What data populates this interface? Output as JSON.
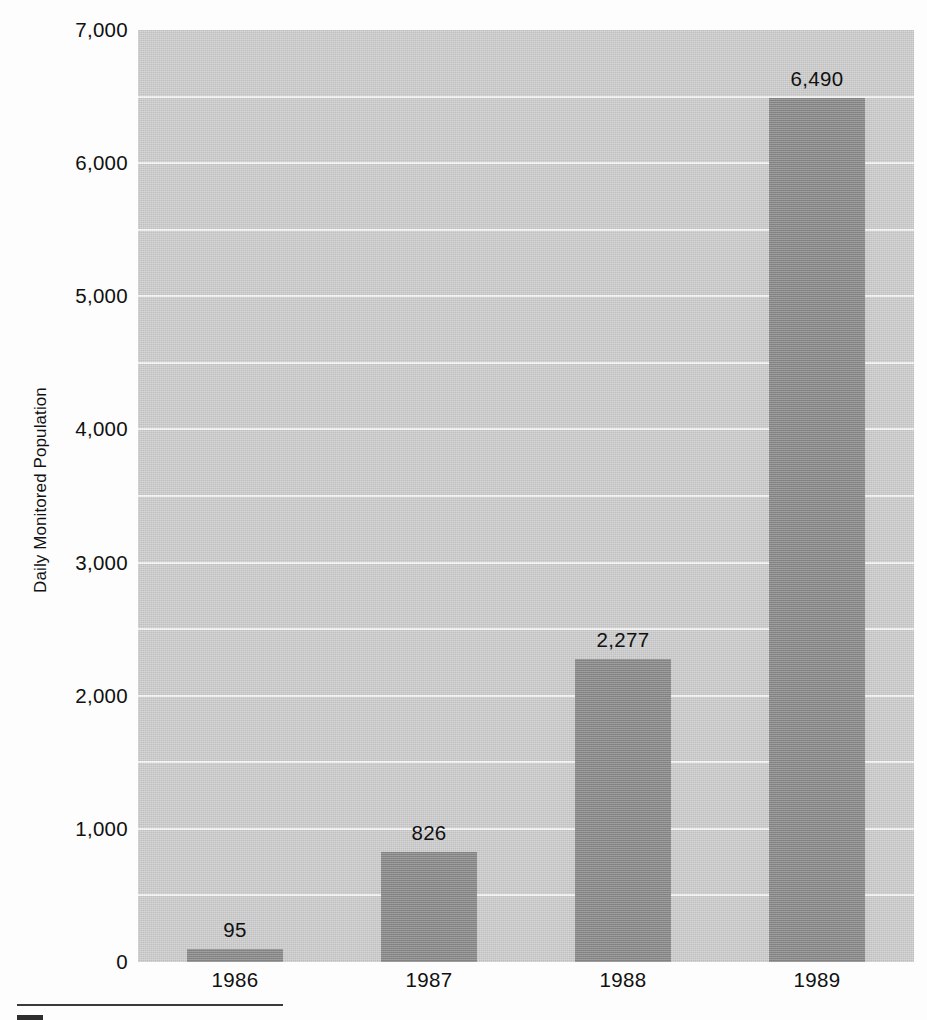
{
  "chart_data": {
    "type": "bar",
    "title": "",
    "xlabel": "",
    "ylabel": "Daily Monitored Population",
    "categories": [
      "1986",
      "1987",
      "1988",
      "1989"
    ],
    "values": [
      95,
      826,
      2277,
      6490
    ],
    "value_labels": [
      "95",
      "826",
      "2,277",
      "6,490"
    ],
    "ylim": [
      0,
      7000
    ],
    "y_ticks": [
      0,
      1000,
      2000,
      3000,
      4000,
      5000,
      6000,
      7000
    ],
    "y_tick_labels": [
      "0",
      "1,000",
      "2,000",
      "3,000",
      "4,000",
      "5,000",
      "6,000",
      "7,000"
    ],
    "gridline_interval": 500,
    "grid": true,
    "legend": "none",
    "colors": {
      "bar": "#8b8b8b",
      "plot_background": "#cdcdcd",
      "gridline": "#f6f6f6",
      "text": "#111111",
      "page_background": "#fdfdfd",
      "footer_rule": "#3a3a3a"
    }
  }
}
